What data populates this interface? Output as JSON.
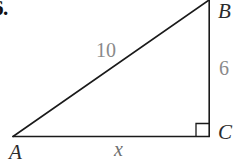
{
  "figure": {
    "problem_number": "6.",
    "type": "right-triangle-diagram",
    "vertices": {
      "a": {
        "label": "A",
        "x": 13,
        "y": 136
      },
      "b": {
        "label": "B",
        "x": 209,
        "y": 0
      },
      "c": {
        "label": "C",
        "x": 209,
        "y": 136
      }
    },
    "sides": {
      "hypotenuse": {
        "label": "10",
        "from": "A",
        "to": "B"
      },
      "vertical_leg": {
        "label": "6",
        "from": "B",
        "to": "C"
      },
      "horizontal_leg": {
        "label": "x",
        "from": "A",
        "to": "C"
      }
    },
    "right_angle": {
      "at_vertex": "C",
      "marker": "right-angle-square",
      "size": 13
    },
    "colors": {
      "line": "#1a1a1a",
      "vertex_text": "#2b2b2b",
      "measure_text": "#8a8a8a",
      "variable_text": "#6f6f6f",
      "background": "#ffffff"
    }
  }
}
